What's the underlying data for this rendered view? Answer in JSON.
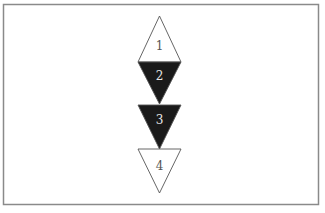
{
  "figure": {
    "frame": {
      "x": 3.5,
      "y": 4.5,
      "width": 315,
      "height": 200,
      "stroke": "#8a8a8a"
    },
    "shapes": [
      {
        "id": 1,
        "label": "1",
        "direction": "up",
        "fill": "#ffffff",
        "text_color": "#555555",
        "points": "159.5,16 138,62 181,62",
        "label_x": 159.5,
        "label_y": 50
      },
      {
        "id": 2,
        "label": "2",
        "direction": "down",
        "fill": "#1a1a1a",
        "text_color": "#e8e8e8",
        "points": "138,62 181,62 159.5,104",
        "label_x": 159.5,
        "label_y": 80
      },
      {
        "id": 3,
        "label": "3",
        "direction": "down",
        "fill": "#1a1a1a",
        "text_color": "#e8e8e8",
        "points": "138,105 181,105 159.5,149",
        "label_x": 159.5,
        "label_y": 124
      },
      {
        "id": 4,
        "label": "4",
        "direction": "down",
        "fill": "#ffffff",
        "text_color": "#555555",
        "points": "138,149 181,149 159.5,193",
        "label_x": 159.5,
        "label_y": 170
      }
    ],
    "stroke_color": "#555555"
  }
}
